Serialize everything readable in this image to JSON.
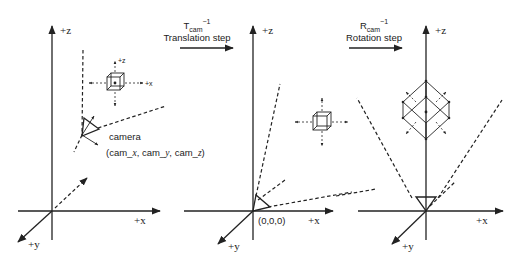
{
  "panels": [
    {
      "id": "world",
      "axes": {
        "z": "+z",
        "x": "+x",
        "y": "+y"
      },
      "camera_label": "camera",
      "camera_coords": "(cam_x, cam_y, cam_z)",
      "cube_axes": {
        "z": "+z",
        "x": "+x"
      }
    },
    {
      "id": "translated",
      "step_matrix": "T",
      "step_subscript": "cam",
      "step_superscript": "−1",
      "step_label": "Translation step",
      "axes": {
        "z": "+z",
        "x": "+x",
        "y": "+y"
      },
      "origin_label": "(0,0,0)"
    },
    {
      "id": "rotated",
      "step_matrix": "R",
      "step_subscript": "cam",
      "step_superscript": "−1",
      "step_label": "Rotation step",
      "axes": {
        "z": "+z",
        "x": "+x",
        "y": "+y"
      }
    }
  ],
  "colors": {
    "ink": "#222222",
    "background": "#ffffff"
  }
}
